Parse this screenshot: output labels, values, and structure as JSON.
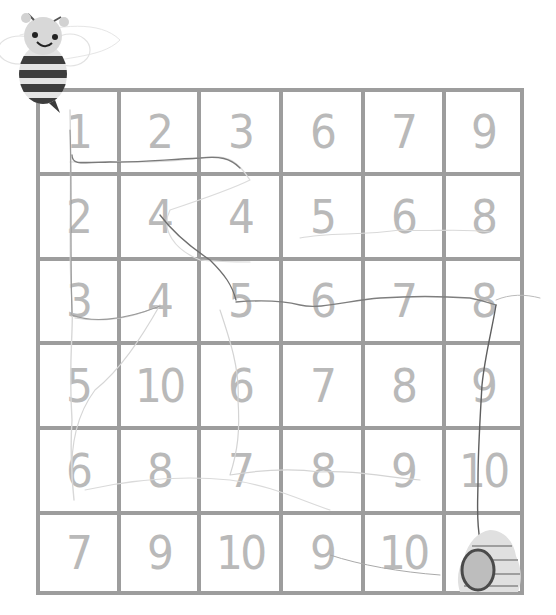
{
  "puzzle": {
    "type": "number-path maze",
    "rows": 6,
    "cols": 6,
    "grid": [
      [
        "1",
        "2",
        "3",
        "6",
        "7",
        "9"
      ],
      [
        "2",
        "4",
        "4",
        "5",
        "6",
        "8"
      ],
      [
        "3",
        "4",
        "5",
        "6",
        "7",
        "8"
      ],
      [
        "5",
        "10",
        "6",
        "7",
        "8",
        "9"
      ],
      [
        "6",
        "8",
        "7",
        "8",
        "9",
        "10"
      ],
      [
        "7",
        "9",
        "10",
        "9",
        "10",
        ""
      ]
    ],
    "start_character": "bee",
    "goal": "beehive",
    "goal_cell": {
      "row": 6,
      "col": 6
    }
  },
  "colors": {
    "grid_line": "#9d9d9d",
    "digit": "#b6b6b6",
    "bee_dark": "#3c3c3c",
    "bee_light": "#d6d6d6",
    "hive": "#dcdcdc",
    "pencil": "#6a6a6a"
  },
  "icons": {
    "start": "bee-icon",
    "goal": "beehive-icon"
  }
}
